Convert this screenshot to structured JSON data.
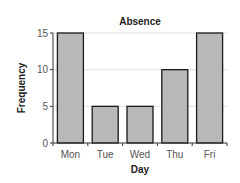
{
  "chart_data": {
    "type": "bar",
    "title": "Absence",
    "xlabel": "Day",
    "ylabel": "Frequency",
    "categories": [
      "Mon",
      "Tue",
      "Wed",
      "Thu",
      "Fri"
    ],
    "values": [
      15,
      5,
      5,
      10,
      15
    ],
    "ylim": [
      0,
      15
    ],
    "yticks": [
      0,
      5,
      10,
      15
    ],
    "grid": true,
    "legend": null,
    "colors": {
      "bar_fill": "#b8b8b8",
      "bar_stroke": "#1a1a1a",
      "grid": "#d8d8d8",
      "axis": "#333333"
    }
  }
}
